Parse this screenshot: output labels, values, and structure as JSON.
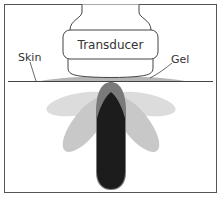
{
  "diagram": {
    "labels": {
      "transducer": "Transducer",
      "skin": "Skin",
      "gel": "Gel"
    },
    "colors": {
      "frame": "#555555",
      "line": "#444444",
      "gel": "#b5b5b5",
      "side_lobe_outer": "#d9d9d9",
      "side_lobe_inner": "#c4c4c4",
      "main_lobe_sheath": "#7a7a7a",
      "main_lobe_core": "#1c1c1c"
    }
  }
}
